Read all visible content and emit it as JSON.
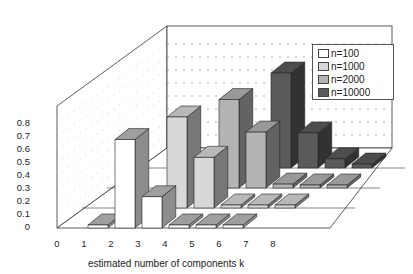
{
  "chart_data": {
    "type": "bar",
    "subtype": "3d-grouped-depth",
    "title": "",
    "xlabel": "estimated number of components k",
    "ylabel": "",
    "categories": [
      "0",
      "1",
      "2",
      "3",
      "4",
      "5",
      "6",
      "7",
      "8"
    ],
    "yticks": [
      "0",
      "0.1",
      "0.2",
      "0.3",
      "0.4",
      "0.5",
      "0.6",
      "0.7",
      "0.8"
    ],
    "ylim": [
      0,
      0.8
    ],
    "grid": true,
    "legend_position": "upper right",
    "series": [
      {
        "name": "n=100",
        "color": "#ffffff",
        "values": [
          0,
          0.02,
          0.68,
          0.24,
          0.01,
          0.01,
          0.01,
          0,
          0
        ]
      },
      {
        "name": "n=1000",
        "color": "#d8d8d8",
        "values": [
          0,
          0,
          0.02,
          0.7,
          0.39,
          0.01,
          0.01,
          0.01,
          0
        ]
      },
      {
        "name": "n=2000",
        "color": "#b4b4b4",
        "values": [
          0,
          0,
          0,
          0.02,
          0.68,
          0.43,
          0.03,
          0.01,
          0.01
        ]
      },
      {
        "name": "n=10000",
        "color": "#5a5a5a",
        "values": [
          0,
          0,
          0,
          0,
          0.02,
          0.73,
          0.27,
          0.07,
          0.03
        ]
      }
    ]
  }
}
